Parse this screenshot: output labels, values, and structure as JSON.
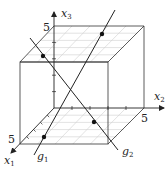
{
  "diagram": {
    "type": "3d-coordinate-system-with-cube-and-lines",
    "axes": {
      "x1": {
        "label": "x",
        "sub": "1",
        "tick_label": "5"
      },
      "x2": {
        "label": "x",
        "sub": "2",
        "tick_label": "5"
      },
      "x3": {
        "label": "x",
        "sub": "3",
        "tick_label": "5"
      }
    },
    "cube": {
      "edge_length": 5,
      "shaded_faces": [
        "bottom (x3=0)",
        "top (x3=5)"
      ]
    },
    "lines": [
      {
        "name": "g",
        "sub": "1",
        "marked_points": 2
      },
      {
        "name": "g",
        "sub": "2",
        "marked_points": 2
      }
    ],
    "colors": {
      "stroke": "#222222",
      "grid": "#c8c8c8",
      "point": "#111111"
    }
  }
}
